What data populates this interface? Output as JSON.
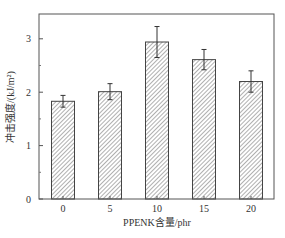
{
  "chart_data": {
    "type": "bar",
    "title": "",
    "xlabel": "PPENK含量/phr",
    "ylabel": "冲击强度/(kJ/m²)",
    "categories": [
      "0",
      "5",
      "10",
      "15",
      "20"
    ],
    "values": [
      1.83,
      2.01,
      2.94,
      2.61,
      2.2
    ],
    "error_plus": [
      0.11,
      0.15,
      0.29,
      0.19,
      0.2
    ],
    "error_minus": [
      0.11,
      0.15,
      0.29,
      0.19,
      0.2
    ],
    "ylim": [
      0,
      3.4
    ],
    "yticks": [
      0,
      1,
      2,
      3
    ],
    "yminor_ticks": [
      0.5,
      1.5,
      2.5
    ],
    "grid": false,
    "legend": null,
    "bar_fill": "diagonal-hatch",
    "colors": {
      "frame": "#555555",
      "bar_edge": "#444444",
      "hatch": "#7a7a7a",
      "text": "#333333"
    }
  },
  "axes": {
    "x_title": "PPENK含量/phr",
    "y_title": "冲击强度/(kJ/m²)"
  }
}
